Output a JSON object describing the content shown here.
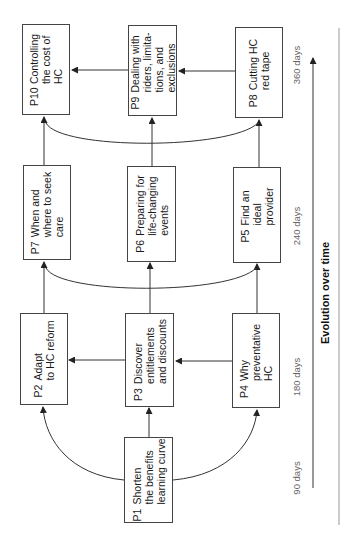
{
  "diagram": {
    "orientation": "rotated-90-ccw",
    "boxes": [
      {
        "id": "P1",
        "code": "P1",
        "lines": [
          "Shorten",
          "the benefits",
          "learning curve"
        ]
      },
      {
        "id": "P2",
        "code": "P2",
        "lines": [
          "Adapt",
          "to HC reform"
        ]
      },
      {
        "id": "P3",
        "code": "P3",
        "lines": [
          "Discover",
          "entitlements",
          "and discounts"
        ]
      },
      {
        "id": "P4",
        "code": "P4",
        "lines": [
          "Why",
          "preventative",
          "HC"
        ]
      },
      {
        "id": "P5",
        "code": "P5",
        "lines": [
          "Find an",
          "ideal",
          "provider"
        ]
      },
      {
        "id": "P6",
        "code": "P6",
        "lines": [
          "Preparing for",
          "life-changing",
          "events"
        ]
      },
      {
        "id": "P7",
        "code": "P7",
        "lines": [
          "When and",
          "where to seek",
          "care"
        ]
      },
      {
        "id": "P8",
        "code": "P8",
        "lines": [
          "Cutting HC",
          "red tape"
        ]
      },
      {
        "id": "P9",
        "code": "P9",
        "lines": [
          "Dealing with",
          "riders, limita-",
          "tions, and",
          "exclusions"
        ]
      },
      {
        "id": "P10",
        "code": "P10",
        "lines": [
          "Controlling",
          "the cost of",
          "HC"
        ]
      }
    ],
    "edges": [
      {
        "from": "P1",
        "to": "P2",
        "style": "curve"
      },
      {
        "from": "P1",
        "to": "P3",
        "style": "straight"
      },
      {
        "from": "P1",
        "to": "P4",
        "style": "curve"
      },
      {
        "from": "P4",
        "to": "P3",
        "style": "straight"
      },
      {
        "from": "P3",
        "to": "P2",
        "style": "straight"
      },
      {
        "from": "P2",
        "to": "P7",
        "style": "straight"
      },
      {
        "from": "P3",
        "to": "P6",
        "style": "straight"
      },
      {
        "from": "P4",
        "to": "P5",
        "style": "straight"
      },
      {
        "from": "P7",
        "to": "P5",
        "style": "curve-bidirectional"
      },
      {
        "from": "P7",
        "to": "P10",
        "style": "straight"
      },
      {
        "from": "P6",
        "to": "P9",
        "style": "straight"
      },
      {
        "from": "P5",
        "to": "P8",
        "style": "straight"
      },
      {
        "from": "P10",
        "to": "P8",
        "style": "curve-bidirectional"
      },
      {
        "from": "P8",
        "to": "P9",
        "style": "straight"
      },
      {
        "from": "P9",
        "to": "P10",
        "style": "straight"
      }
    ],
    "timeline": {
      "title": "Evolution over time",
      "ticks": [
        "90 days",
        "180 days",
        "240 days",
        "360 days"
      ]
    },
    "colors": {
      "line": "#333333",
      "box_border": "#444444",
      "tick_text": "#666666",
      "axis_light": "#999999"
    }
  }
}
